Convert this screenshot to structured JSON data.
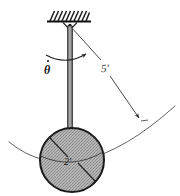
{
  "figure": {
    "type": "engineering-mechanics-diagram",
    "labels": {
      "angular_velocity": "θ",
      "angular_velocity_full": "θ̇",
      "rod_length": "5'",
      "sphere_diameter": "2'"
    },
    "colors": {
      "outline": "#1a1a1a",
      "sphere_fill": "#a9a9a9",
      "rod_fill": "#8c8c8c",
      "rod_highlight": "#b5b5b5",
      "hatch": "#222222",
      "arc_stroke": "#555555",
      "dimension_stroke": "#4a4a4a",
      "background": "#ffffff"
    },
    "geometry": {
      "pivot_x": 70,
      "pivot_y": 26,
      "sphere_center_x": 72,
      "sphere_center_y": 160,
      "sphere_radius": 32,
      "ceiling_y": 22,
      "ceiling_left": 48,
      "ceiling_right": 90
    }
  }
}
